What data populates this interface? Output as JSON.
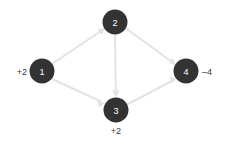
{
  "diagram": {
    "background_color": "#ffffff",
    "node_color": "#333333",
    "node_label_color": "#ffffff",
    "edge_color": "#e3e3e3",
    "annotation_color": "#3a3a3a",
    "nodes": [
      {
        "id": "1",
        "label": "1",
        "cx": 42,
        "cy": 71,
        "r": 12.5,
        "annotation": "+2",
        "annotation_position": "left"
      },
      {
        "id": "2",
        "label": "2",
        "cx": 115,
        "cy": 22,
        "r": 12.5,
        "annotation": "",
        "annotation_position": "none"
      },
      {
        "id": "3",
        "label": "3",
        "cx": 116,
        "cy": 110,
        "r": 12.5,
        "annotation": "+2",
        "annotation_position": "below"
      },
      {
        "id": "4",
        "label": "4",
        "cx": 186,
        "cy": 71,
        "r": 12.5,
        "annotation": "–4",
        "annotation_position": "right"
      }
    ],
    "edges": [
      {
        "from": "1",
        "to": "2",
        "directed": true
      },
      {
        "from": "1",
        "to": "3",
        "directed": true
      },
      {
        "from": "2",
        "to": "3",
        "directed": true
      },
      {
        "from": "2",
        "to": "4",
        "directed": true
      },
      {
        "from": "3",
        "to": "4",
        "directed": true
      }
    ],
    "labels": {
      "node_1_value": "1",
      "node_2_value": "2",
      "node_3_value": "3",
      "node_4_value": "4",
      "node_1_annotation": "+2",
      "node_3_annotation": "+2",
      "node_4_annotation": "–4"
    }
  }
}
